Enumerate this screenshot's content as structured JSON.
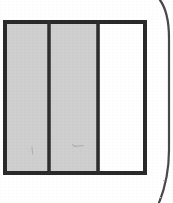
{
  "document": {
    "kind": "scanned-line-drawing",
    "title": "Three-panel rectangle diagram",
    "background_color": "#ffffff",
    "width": 173,
    "height": 203
  },
  "figure": {
    "name": "three-panel-rectangle",
    "outline": {
      "x": 3,
      "y": 20,
      "width": 144,
      "height": 155,
      "stroke_color": "#2b2b2b",
      "stroke_width": 4,
      "fill_color": "none"
    },
    "panels": [
      {
        "id": "panel-left",
        "label": "left-shaded-panel",
        "fill_color": "#cfcfcf",
        "shaded": true,
        "x": 5,
        "y": 22,
        "width": 42,
        "height": 151
      },
      {
        "id": "panel-middle",
        "label": "middle-shaded-panel",
        "fill_color": "#cfcfcf",
        "shaded": true,
        "x": 51,
        "y": 22,
        "width": 45,
        "height": 151
      },
      {
        "id": "panel-right",
        "label": "right-unshaded-panel",
        "fill_color": "#ffffff",
        "shaded": false,
        "x": 100,
        "y": 22,
        "width": 45,
        "height": 151
      }
    ],
    "dividers": [
      {
        "id": "divider-1",
        "label": "divider-left-middle",
        "x": 48.5,
        "y_top": 20,
        "y_bottom": 175,
        "stroke_color": "#2d2d2d",
        "stroke_width": 3.5
      },
      {
        "id": "divider-2",
        "label": "divider-middle-right",
        "x": 97.5,
        "y_top": 20,
        "y_bottom": 175,
        "stroke_color": "#2d2d2d",
        "stroke_width": 3.5
      }
    ],
    "annotations": [
      {
        "id": "mark-left",
        "label": "faint-tick-left-panel",
        "shape": "short-vertical-stroke",
        "x": 32,
        "y": 150,
        "length": 7,
        "stroke_color": "#9a9a9a"
      },
      {
        "id": "mark-middle",
        "label": "faint-dash-middle-panel",
        "shape": "short-horizontal-stroke",
        "x": 74,
        "y": 146,
        "length": 9,
        "stroke_color": "#9a9a9a"
      }
    ]
  },
  "page_edge": {
    "name": "scanned-page-edge-curve",
    "description": "curved dark line at right margin from page border",
    "stroke_color": "#4a4a4a",
    "stroke_width": 2.2,
    "path": "M 160 0 C 167 10 169 22 169 38 L 169 150 C 169 172 165 188 159 203"
  },
  "colors": {
    "ink": "#2b2b2b",
    "shade": "#cfcfcf",
    "paper": "#ffffff",
    "edge": "#4a4a4a",
    "faint": "#9a9a9a"
  }
}
